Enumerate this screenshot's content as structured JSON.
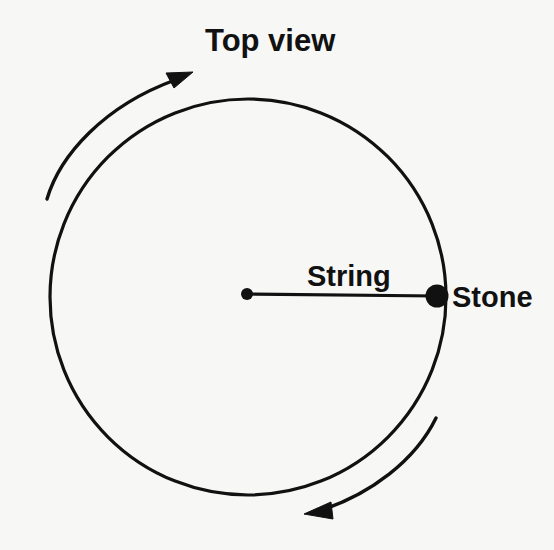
{
  "figure": {
    "title_label": "Top view",
    "string_label": "String",
    "stone_label": "Stone",
    "background_color": "#f7f7f6",
    "ink_color": "#111111"
  },
  "geometry": {
    "circle": {
      "cx": 248,
      "cy": 297,
      "r": 198,
      "stroke_width": 3.2
    },
    "center_dot": {
      "cx": 247,
      "cy": 294,
      "r": 6
    },
    "stone_dot": {
      "cx": 437,
      "cy": 296,
      "r": 11.5
    },
    "string_line": {
      "x1": 247,
      "y1": 294,
      "x2": 437,
      "y2": 296
    }
  },
  "labels": {
    "top_view": {
      "x": 205,
      "y": 51
    },
    "string": {
      "x": 307,
      "y": 286
    },
    "stone": {
      "x": 452,
      "y": 307
    }
  },
  "rotation_arrows": [
    {
      "name": "upper-left-rotation-arrow",
      "direction": "up-right",
      "path": "M 47 199 C 63 150 110 102 178 79",
      "head_points": "178,79 192,72 170,62"
    },
    {
      "name": "lower-right-rotation-arrow",
      "direction": "down-left",
      "path": "M 435 419 C 412 462 367 495 318 511",
      "head_points": "318,511 306,514 329,522"
    }
  ]
}
